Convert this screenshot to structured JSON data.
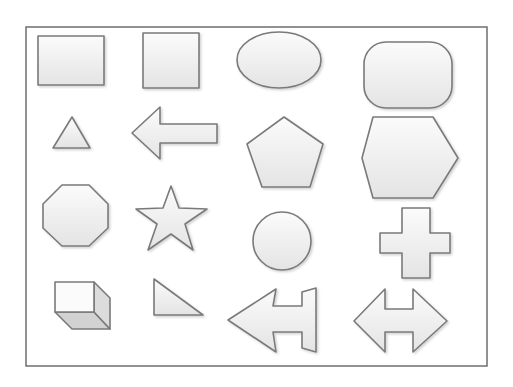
{
  "diagram": {
    "colors": {
      "background": "#ffffff",
      "frame_stroke": "#6e6e6e",
      "shape_stroke": "#7a7a7a",
      "fill_light": "#fbfbfb",
      "fill_dark": "#e4e4e4",
      "cube_shade_side": "#dcdcdc",
      "cube_shade_bottom": "#d2d2d2"
    },
    "frame": {
      "x": 26,
      "y": 27,
      "width": 461,
      "height": 339
    },
    "rows": [
      {
        "shapes": [
          "rectangle",
          "square",
          "ellipse",
          "rounded-rectangle"
        ]
      },
      {
        "shapes": [
          "triangle",
          "left-arrow",
          "pentagon",
          "hexagon"
        ]
      },
      {
        "shapes": [
          "octagon",
          "star",
          "circle",
          "cross"
        ]
      },
      {
        "shapes": [
          "cube",
          "right-triangle",
          "left-arrow-with-cap",
          "left-right-arrow"
        ]
      }
    ],
    "shapes": [
      {
        "name": "rectangle",
        "type": "rect",
        "x": 38,
        "y": 36,
        "w": 66,
        "h": 49
      },
      {
        "name": "square",
        "type": "rect",
        "x": 143,
        "y": 33,
        "w": 56,
        "h": 55
      },
      {
        "name": "ellipse",
        "type": "ellipse",
        "cx": 279,
        "cy": 60,
        "rx": 42,
        "ry": 28
      },
      {
        "name": "rounded-rectangle",
        "type": "rect",
        "x": 364,
        "y": 42,
        "w": 88,
        "h": 66,
        "r": 22
      },
      {
        "name": "triangle",
        "type": "polygon",
        "points": "72,117 90,148 53,148"
      },
      {
        "name": "left-arrow",
        "type": "polygon",
        "points": "132,133 160,107 160,124 217,124 217,143 160,143 160,159"
      },
      {
        "name": "pentagon",
        "type": "polygon",
        "points": "284,117 323,144 310,187 262,187 247,144"
      },
      {
        "name": "hexagon",
        "type": "polygon",
        "points": "373,117 433,117 458,158 433,198 373,198 362,158"
      },
      {
        "name": "octagon",
        "type": "polygon",
        "points": "62,185 89,185 108,204 108,228 89,246 62,246 43,228 43,204"
      },
      {
        "name": "star",
        "type": "polygon",
        "points": "171,186 179,208 207,209 185,224 193,250 171,234 148,250 157,224 136,209 163,208"
      },
      {
        "name": "circle",
        "type": "circle",
        "cx": 282,
        "cy": 241,
        "r": 29
      },
      {
        "name": "cross",
        "type": "polygon",
        "points": "402,208 430,208 430,233 450,233 450,253 430,253 430,278 402,278 402,253 380,253 380,233 402,233"
      },
      {
        "name": "right-triangle",
        "type": "polygon",
        "points": "154,279 203,315 154,315"
      },
      {
        "name": "left-arrow-with-cap",
        "type": "polygon",
        "points": "228,320 276,289 273,306 302,306 302,292 316,288 316,352 302,348 302,332 273,332 276,352"
      },
      {
        "name": "left-right-arrow",
        "type": "polygon",
        "points": "354,321 385,289 385,309 413,309 413,289 447,321 413,352 413,332 385,332 385,352"
      }
    ],
    "cube": {
      "name": "cube",
      "front": "55,282 94,282 94,312 55,312",
      "side": "94,282 110,298 110,329 94,312",
      "bottom": "55,312 94,312 110,329 72,329"
    }
  }
}
